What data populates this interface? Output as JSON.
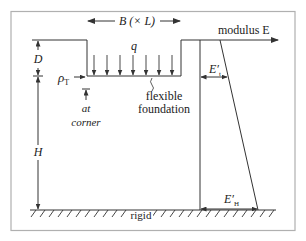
{
  "figure": {
    "frame_color": "#b0b0b0",
    "line_color": "#333333",
    "labels": {
      "width": "B (× L)",
      "load": "q",
      "depth": "D",
      "layer_thickness": "H",
      "settlement_symbol": "ρ",
      "settlement_subscript": "T",
      "at": "at",
      "corner": "corner",
      "foundation_line1": "flexible",
      "foundation_line2": "foundation",
      "modulus_axis": "modulus E",
      "modulus_top": "E′",
      "modulus_top_sub": "t",
      "modulus_bottom": "E′",
      "modulus_bottom_sub": "H",
      "base": "rigid"
    }
  }
}
